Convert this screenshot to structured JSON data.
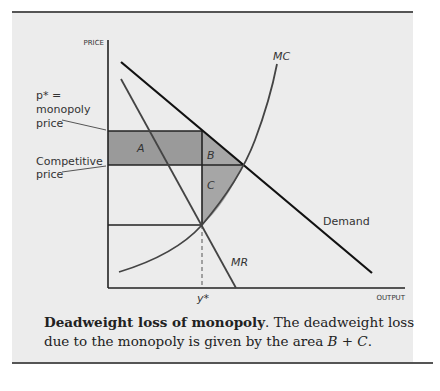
{
  "diagram": {
    "axes": {
      "y_label": "PRICE",
      "x_label": "OUTPUT"
    },
    "curves": {
      "mc": "MC",
      "mr": "MR",
      "demand": "Demand"
    },
    "regions": {
      "a": "A",
      "b": "B",
      "c": "C"
    },
    "annotations": {
      "monopoly_price_line1": "p* =",
      "monopoly_price_line2": "monopoly",
      "monopoly_price_line3": "price",
      "competitive_price_line1": "Competitive",
      "competitive_price_line2": "price",
      "y_star": "y*"
    },
    "colors": {
      "background": "#ececec",
      "region_a": "#9a9a9a",
      "region_bc": "#a6a6a6",
      "lines": "#222222"
    }
  },
  "caption": {
    "title": "Deadweight loss of monopoly",
    "text": ". The deadweight loss due to the monopoly is given by the area ",
    "expr": "B + C",
    "end": "."
  }
}
